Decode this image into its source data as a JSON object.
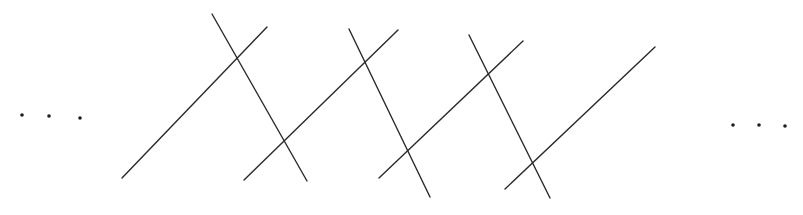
{
  "diagram": {
    "stroke_color": "#2a2a2a",
    "background": "#ffffff",
    "ellipsis_left": {
      "label": "...",
      "dots": [
        [
          22,
          115
        ],
        [
          49,
          116
        ],
        [
          80,
          118
        ]
      ]
    },
    "ellipsis_right": {
      "label": "...",
      "dots": [
        [
          733,
          125
        ],
        [
          759,
          125
        ],
        [
          785,
          126
        ]
      ]
    },
    "lines": [
      {
        "id": "ascending-1",
        "direction": "up-right",
        "x1": 122,
        "y1": 178,
        "x2": 267,
        "y2": 27
      },
      {
        "id": "descending-1",
        "direction": "down-right",
        "x1": 212,
        "y1": 14,
        "x2": 307,
        "y2": 181
      },
      {
        "id": "ascending-2",
        "direction": "up-right",
        "x1": 244,
        "y1": 180,
        "x2": 398,
        "y2": 30
      },
      {
        "id": "descending-2",
        "direction": "down-right",
        "x1": 349,
        "y1": 29,
        "x2": 430,
        "y2": 197
      },
      {
        "id": "ascending-3",
        "direction": "up-right",
        "x1": 379,
        "y1": 178,
        "x2": 523,
        "y2": 41
      },
      {
        "id": "descending-3",
        "direction": "down-right",
        "x1": 469,
        "y1": 35,
        "x2": 550,
        "y2": 198
      },
      {
        "id": "ascending-4",
        "direction": "up-right",
        "x1": 505,
        "y1": 189,
        "x2": 655,
        "y2": 47
      }
    ]
  }
}
